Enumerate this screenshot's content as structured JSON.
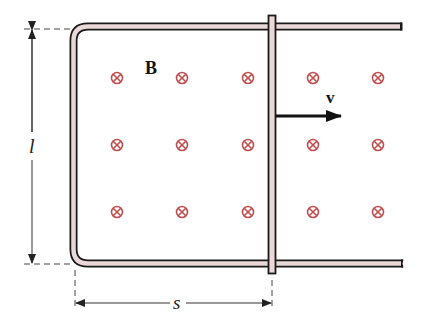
{
  "diagram": {
    "type": "physics-sliding-bar-on-rails",
    "labels": {
      "field": "B",
      "velocity": "v",
      "length": "l",
      "separation": "s"
    },
    "field_symbol": "into-page (⊗)",
    "field_grid": {
      "columns_x": [
        117,
        182,
        248,
        313,
        378
      ],
      "rows_y": [
        78,
        145,
        212
      ]
    },
    "colors": {
      "rail_fill": "#ead8d8",
      "rail_outline": "#1a1a1a",
      "field_symbol": "#c0504f",
      "arrow": "#111111",
      "dimension_line": "#333333",
      "background": "#ffffff"
    }
  }
}
